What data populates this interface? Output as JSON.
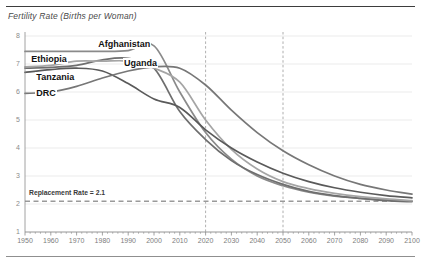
{
  "chart_data": {
    "type": "line",
    "title": "Fertility Rate (Births per Woman)",
    "xlabel": "",
    "ylabel": "",
    "xlim": [
      1950,
      2100
    ],
    "ylim": [
      1,
      8
    ],
    "grid": true,
    "legend_position": "inline-labels",
    "yticks": [
      "8",
      "7",
      "6",
      "5",
      "4",
      "3",
      "2",
      "1"
    ],
    "ytick_values": [
      8,
      7,
      6,
      5,
      4,
      3,
      2,
      1
    ],
    "xticks": [
      "1950",
      "1960",
      "1970",
      "1980",
      "1990",
      "2000",
      "2010",
      "2020",
      "2030",
      "2040",
      "2050",
      "2060",
      "2070",
      "2080",
      "2090",
      "2100"
    ],
    "xtick_values": [
      1950,
      1960,
      1970,
      1980,
      1990,
      2000,
      2010,
      2020,
      2030,
      2040,
      2050,
      2060,
      2070,
      2080,
      2090,
      2100
    ],
    "x": [
      1950,
      1960,
      1970,
      1980,
      1990,
      2000,
      2010,
      2020,
      2030,
      2040,
      2050,
      2060,
      2070,
      2080,
      2090,
      2100
    ],
    "annotations": [
      {
        "name": "replacement-rate",
        "text": "Replacement Rate = 2.1",
        "value": 2.1,
        "style": "dashed-horizontal"
      },
      {
        "name": "year-2020-marker",
        "text": "",
        "value": 2020,
        "style": "dashed-vertical"
      },
      {
        "name": "year-2050-marker",
        "text": "",
        "value": 2050,
        "style": "dashed-vertical"
      }
    ],
    "series": [
      {
        "name": "Afghanistan",
        "color": "#8a8a8a",
        "label_x": 1978,
        "label_y": 7.72,
        "values": [
          7.45,
          7.45,
          7.45,
          7.45,
          7.48,
          7.65,
          6.0,
          4.55,
          3.6,
          3.0,
          2.65,
          2.42,
          2.28,
          2.2,
          2.15,
          2.1
        ]
      },
      {
        "name": "Ethiopia",
        "color": "#6e6e6e",
        "label_x": 1952,
        "label_y": 7.18,
        "values": [
          6.85,
          6.88,
          6.95,
          7.15,
          7.2,
          6.85,
          5.3,
          4.3,
          3.55,
          3.05,
          2.7,
          2.45,
          2.3,
          2.2,
          2.12,
          2.08
        ]
      },
      {
        "name": "Uganda",
        "color": "#a5a5a5",
        "label_x": 1988,
        "label_y": 7.05,
        "values": [
          6.9,
          6.95,
          7.1,
          7.1,
          7.1,
          6.85,
          6.35,
          5.0,
          3.95,
          3.25,
          2.8,
          2.55,
          2.38,
          2.26,
          2.18,
          2.12
        ]
      },
      {
        "name": "Tanzania",
        "color": "#5a5a5a",
        "label_x": 1954,
        "label_y": 6.55,
        "values": [
          6.7,
          6.8,
          6.85,
          6.75,
          6.3,
          5.75,
          5.45,
          4.65,
          4.0,
          3.5,
          3.1,
          2.8,
          2.58,
          2.42,
          2.3,
          2.22
        ]
      },
      {
        "name": "DRC",
        "color": "#777777",
        "label_x": 1954,
        "label_y": 5.95,
        "values": [
          5.95,
          6.0,
          6.2,
          6.5,
          6.75,
          6.9,
          6.85,
          6.25,
          5.35,
          4.55,
          3.9,
          3.4,
          3.0,
          2.7,
          2.5,
          2.35
        ]
      }
    ]
  },
  "colors": {
    "axis": "#8b8b8b",
    "grid": "#e3e3e3",
    "marker": "#9a9a9a",
    "replacement": "#9a9a9a",
    "rule_top": "#3d3d3d",
    "rule_bottom": "#8f8f8f"
  }
}
